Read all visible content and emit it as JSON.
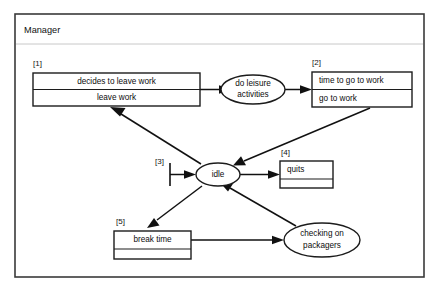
{
  "frame": {
    "title": "Manager",
    "border_color": "#3a3a3a",
    "background": "#ffffff"
  },
  "colors": {
    "stroke": "#1c1c1c",
    "edge": "#111111",
    "text": "#0d0d0d",
    "frame_separator": "#c8c8c8"
  },
  "tags": {
    "t1": "[1]",
    "t2": "[2]",
    "t3": "[3]",
    "t4": "[4]",
    "t5": "[5]"
  },
  "nodes": {
    "box1": {
      "tag": "[1]",
      "row_top": "decides to leave work",
      "row_bottom": "leave work",
      "align": "center"
    },
    "box2": {
      "tag": "[2]",
      "row_top": "time to go to work",
      "row_bottom": "go to work",
      "align": "left"
    },
    "box4": {
      "tag": "[4]",
      "row_top": "quits",
      "row_bottom": "",
      "align": "left"
    },
    "box5": {
      "tag": "[5]",
      "row_top": "break time",
      "row_bottom": "",
      "align": "center"
    },
    "ellipse_leisure": {
      "line1": "do leisure",
      "line2": "activities"
    },
    "ellipse_idle": {
      "line1": "idle"
    },
    "ellipse_packagers": {
      "line1": "checking on",
      "line2": "packagers"
    }
  },
  "edges": [
    {
      "name": "box1-to-leisure",
      "from": "box1",
      "to": "ellipse_leisure"
    },
    {
      "name": "leisure-to-box2",
      "from": "ellipse_leisure",
      "to": "box2"
    },
    {
      "name": "box2-to-idle",
      "from": "box2",
      "to": "ellipse_idle"
    },
    {
      "name": "idle-to-box1",
      "from": "ellipse_idle",
      "to": "box1"
    },
    {
      "name": "start-to-idle",
      "from": "start_marker",
      "to": "ellipse_idle"
    },
    {
      "name": "idle-to-box4",
      "from": "ellipse_idle",
      "to": "box4"
    },
    {
      "name": "idle-to-box5",
      "from": "ellipse_idle",
      "to": "box5"
    },
    {
      "name": "box5-to-packagers",
      "from": "box5",
      "to": "ellipse_packagers"
    },
    {
      "name": "packagers-to-idle",
      "from": "ellipse_packagers",
      "to": "ellipse_idle"
    }
  ]
}
